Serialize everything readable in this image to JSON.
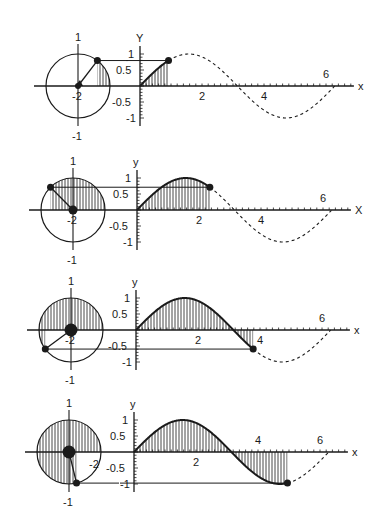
{
  "colors": {
    "ink": "#1a1a1a",
    "background": "#ffffff"
  },
  "panels": [
    {
      "id": "panel-1",
      "angle": 0.92,
      "y_axis_label": "Y",
      "x_axis_label": "x",
      "circle_labels": {
        "top": "1",
        "bottom": "-1",
        "center": "-2"
      },
      "y_ticks": [
        "1",
        "0.5",
        "-0.5",
        "-1"
      ],
      "x_ticks": [
        "2",
        "4",
        "6"
      ],
      "origin": {
        "cx": 78,
        "cy": 86,
        "ax": 140,
        "ay": 86
      }
    },
    {
      "id": "panel-2",
      "angle": 2.35,
      "y_axis_label": "y",
      "x_axis_label": "X",
      "circle_labels": {
        "top": "1",
        "bottom": "-1",
        "center": "-2"
      },
      "y_ticks": [
        "1",
        "0.5",
        "-0.5",
        "-1"
      ],
      "x_ticks": [
        "2",
        "4",
        "6"
      ],
      "origin": {
        "cx": 73,
        "cy": 210,
        "ax": 137,
        "ay": 210
      }
    },
    {
      "id": "panel-3",
      "angle": 3.78,
      "y_axis_label": "y",
      "x_axis_label": "x",
      "circle_labels": {
        "top": "1",
        "bottom": "-1",
        "center": "-2"
      },
      "y_ticks": [
        "1",
        "0.5",
        "-0.5",
        "-1"
      ],
      "x_ticks": [
        "2",
        "4",
        "6"
      ],
      "origin": {
        "cx": 71,
        "cy": 330,
        "ax": 136,
        "ay": 330
      }
    },
    {
      "id": "panel-4",
      "angle": 4.95,
      "y_axis_label": "y",
      "x_axis_label": "x",
      "circle_labels": {
        "top": "1",
        "bottom": "-1",
        "center": "-2"
      },
      "y_ticks": [
        "1",
        "0.5",
        "-0.5",
        "-1"
      ],
      "x_ticks": [
        "2",
        "4",
        "6"
      ],
      "origin": {
        "cx": 69,
        "cy": 452,
        "ax": 134,
        "ay": 452
      }
    }
  ],
  "scale": {
    "x_px_per_unit": 31,
    "y_px_per_unit": 32,
    "radius_px": 32
  },
  "chart_data": {
    "type": "line",
    "xlabel": "x",
    "ylabel": "y",
    "xlim": [
      0,
      6.4
    ],
    "ylim": [
      -1,
      1
    ],
    "x_tick_labels": [
      "2",
      "4",
      "6"
    ],
    "y_tick_labels": [
      "1",
      "0.5",
      "-0.5",
      "-1"
    ],
    "series": [
      {
        "name": "stage 1",
        "angle": 0.92,
        "point": [
          0.92,
          0.8
        ]
      },
      {
        "name": "stage 2",
        "angle": 2.35,
        "point": [
          2.35,
          0.71
        ]
      },
      {
        "name": "stage 3",
        "angle": 3.78,
        "point": [
          3.78,
          -0.6
        ]
      },
      {
        "name": "stage 4",
        "angle": 4.95,
        "point": [
          4.95,
          -0.97
        ]
      }
    ]
  }
}
